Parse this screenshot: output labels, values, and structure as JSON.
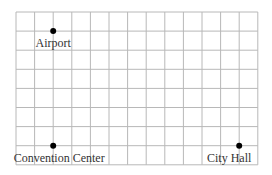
{
  "grid": {
    "columns": 13,
    "rows": 8,
    "origin_x": 16,
    "origin_y": 12,
    "cell_w": 18.6,
    "cell_h": 19.1,
    "line_color": "#b8b8b8"
  },
  "points": [
    {
      "label": "Airport",
      "col": 2,
      "row": 1,
      "label_pos": "below"
    },
    {
      "label": "Convention Center",
      "col": 2,
      "row": 7,
      "label_pos": "below"
    },
    {
      "label": "City Hall",
      "col": 12,
      "row": 7,
      "label_pos": "below"
    }
  ],
  "point_color": "#000000"
}
